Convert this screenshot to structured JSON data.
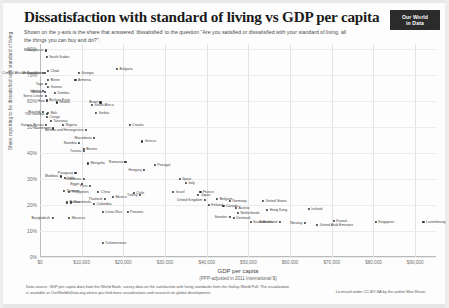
{
  "header": {
    "title": "Dissatisfaction with standard of living vs GDP per capita",
    "subtitle": "Shown on the y-axis is the share that answered 'dissatisfied' to the question \"Are you satisfied or dissatisfied with your standard of living, all the things you can buy and do?\".",
    "logo_line1": "Our World",
    "logo_line2": "in Data"
  },
  "footer": {
    "source": "Data source: GDP per capita data from the World Bank; survey data on the satisfaction with living standards from the Gallup World Poll. The visualization is available at OurWorldInData.org where you find more visualizations and research on global development.",
    "license": "Licensed under CC-BY-SA by the author Max Roser."
  },
  "axes": {
    "y_title": "Share reporting to be dissatisfied with standard of living",
    "x_title": "GDP per capita",
    "x_subtitle": "(PPP-adjusted in 2011 international-$)",
    "y_ticks": [
      "80%",
      "70%",
      "60%",
      "50%",
      "40%",
      "30%",
      "20%",
      "10%",
      "0%"
    ],
    "x_ticks": [
      "$0",
      "$10,000",
      "$20,000",
      "$30,000",
      "$40,000",
      "$50,000",
      "$60,000",
      "$70,000",
      "$80,000",
      "$90,000"
    ]
  },
  "chart_data": {
    "type": "scatter",
    "title": "Dissatisfaction with standard of living vs GDP per capita",
    "xlabel": "GDP per capita (PPP-adjusted in 2011 international-$)",
    "ylabel": "Share reporting to be dissatisfied with standard of living",
    "xlim": [
      0,
      95000
    ],
    "ylim": [
      0,
      82
    ],
    "grid": true,
    "legend": "none",
    "x_unit": "international-$",
    "y_unit": "percent",
    "points": [
      {
        "name": "Madagascar",
        "x": 1400,
        "y": 79.5,
        "side": "left"
      },
      {
        "name": "South Sudan",
        "x": 1600,
        "y": 77.0,
        "side": "right"
      },
      {
        "name": "Chad",
        "x": 1900,
        "y": 71.5,
        "side": "right"
      },
      {
        "name": "Central African Republic",
        "x": 700,
        "y": 71.0,
        "side": "left"
      },
      {
        "name": "Mozambique",
        "x": 1100,
        "y": 71.0,
        "side": "left"
      },
      {
        "name": "Georgia",
        "x": 9300,
        "y": 71.0,
        "side": "right"
      },
      {
        "name": "Bulgaria",
        "x": 18500,
        "y": 72.5,
        "side": "right"
      },
      {
        "name": "Benin",
        "x": 2000,
        "y": 68.0,
        "side": "right"
      },
      {
        "name": "Armenia",
        "x": 8500,
        "y": 68.0,
        "side": "right"
      },
      {
        "name": "Togo",
        "x": 1400,
        "y": 66.5,
        "side": "left"
      },
      {
        "name": "Guinea",
        "x": 1900,
        "y": 65.5,
        "side": "right"
      },
      {
        "name": "Liberia",
        "x": 800,
        "y": 64.0,
        "side": "left"
      },
      {
        "name": "Malawi",
        "x": 1100,
        "y": 63.5,
        "side": "left"
      },
      {
        "name": "Zambia",
        "x": 3600,
        "y": 63.0,
        "side": "right"
      },
      {
        "name": "Sierra Leone",
        "x": 1400,
        "y": 62.0,
        "side": "left"
      },
      {
        "name": "Burkina Faso",
        "x": 1600,
        "y": 60.5,
        "side": "right"
      },
      {
        "name": "Haiti",
        "x": 1700,
        "y": 60.0,
        "side": "left"
      },
      {
        "name": "Brazil",
        "x": 14500,
        "y": 59.5,
        "side": "left"
      },
      {
        "name": "Ghana",
        "x": 4000,
        "y": 59.5,
        "side": "right"
      },
      {
        "name": "South Africa",
        "x": 12500,
        "y": 58.5,
        "side": "right"
      },
      {
        "name": "Burundi",
        "x": 700,
        "y": 56.0,
        "side": "left"
      },
      {
        "name": "Mali",
        "x": 1900,
        "y": 55.5,
        "side": "right"
      },
      {
        "name": "Serbia",
        "x": 13500,
        "y": 55.5,
        "side": "right"
      },
      {
        "name": "The Gambia",
        "x": 1600,
        "y": 55.0,
        "side": "left"
      },
      {
        "name": "Congo",
        "x": 1700,
        "y": 54.0,
        "side": "right"
      },
      {
        "name": "Tanzania",
        "x": 2600,
        "y": 52.5,
        "side": "right"
      },
      {
        "name": "Guinea-Bissau",
        "x": 1500,
        "y": 51.0,
        "side": "left"
      },
      {
        "name": "Nigeria",
        "x": 5600,
        "y": 51.0,
        "side": "right"
      },
      {
        "name": "Croatia",
        "x": 21500,
        "y": 51.0,
        "side": "right"
      },
      {
        "name": "Cameroon",
        "x": 3200,
        "y": 49.5,
        "side": "left"
      },
      {
        "name": "Bosnia and Herzegovina",
        "x": 11000,
        "y": 49.0,
        "side": "left"
      },
      {
        "name": "Macedonia",
        "x": 13000,
        "y": 46.0,
        "side": "left"
      },
      {
        "name": "Greece",
        "x": 24500,
        "y": 44.5,
        "side": "right"
      },
      {
        "name": "Namibia",
        "x": 9400,
        "y": 44.0,
        "side": "left"
      },
      {
        "name": "Tunisia",
        "x": 10500,
        "y": 41.0,
        "side": "left"
      },
      {
        "name": "Bosnia",
        "x": 10500,
        "y": 41.5,
        "side": "right"
      },
      {
        "name": "Romania",
        "x": 20500,
        "y": 36.5,
        "side": "left"
      },
      {
        "name": "Mongolia",
        "x": 11500,
        "y": 36.0,
        "side": "right"
      },
      {
        "name": "Portugal",
        "x": 27500,
        "y": 35.5,
        "side": "right"
      },
      {
        "name": "Hungary",
        "x": 25000,
        "y": 33.5,
        "side": "left"
      },
      {
        "name": "Paraguay",
        "x": 8500,
        "y": 32.5,
        "side": "left"
      },
      {
        "name": "Moldova",
        "x": 5000,
        "y": 31.0,
        "side": "left"
      },
      {
        "name": "India",
        "x": 6000,
        "y": 30.5,
        "side": "right"
      },
      {
        "name": "Indonesia",
        "x": 10500,
        "y": 30.0,
        "side": "left"
      },
      {
        "name": "Spain",
        "x": 33500,
        "y": 30.0,
        "side": "right"
      },
      {
        "name": "Italy",
        "x": 35000,
        "y": 28.5,
        "side": "right"
      },
      {
        "name": "Egypt",
        "x": 10000,
        "y": 28.0,
        "side": "left"
      },
      {
        "name": "Peru",
        "x": 12000,
        "y": 27.5,
        "side": "left"
      },
      {
        "name": "Vietnam",
        "x": 5800,
        "y": 25.5,
        "side": "right"
      },
      {
        "name": "Philippines",
        "x": 7000,
        "y": 25.0,
        "side": "right"
      },
      {
        "name": "China",
        "x": 14000,
        "y": 25.0,
        "side": "right"
      },
      {
        "name": "Israel",
        "x": 32000,
        "y": 25.0,
        "side": "right"
      },
      {
        "name": "France",
        "x": 38500,
        "y": 25.0,
        "side": "right"
      },
      {
        "name": "Japan",
        "x": 38000,
        "y": 24.0,
        "side": "right"
      },
      {
        "name": "Chile",
        "x": 22500,
        "y": 24.5,
        "side": "right"
      },
      {
        "name": "Turkey",
        "x": 24000,
        "y": 24.0,
        "side": "left"
      },
      {
        "name": "Mexico",
        "x": 17500,
        "y": 23.0,
        "side": "right"
      },
      {
        "name": "Thailand",
        "x": 15500,
        "y": 22.5,
        "side": "left"
      },
      {
        "name": "Belgium",
        "x": 42500,
        "y": 22.5,
        "side": "right"
      },
      {
        "name": "Germany",
        "x": 45500,
        "y": 21.5,
        "side": "right"
      },
      {
        "name": "United Kingdom",
        "x": 39500,
        "y": 22.0,
        "side": "left"
      },
      {
        "name": "Guatemala",
        "x": 7500,
        "y": 21.0,
        "side": "right"
      },
      {
        "name": "Bolivia",
        "x": 6500,
        "y": 21.0,
        "side": "right"
      },
      {
        "name": "Colombia",
        "x": 13000,
        "y": 20.5,
        "side": "right"
      },
      {
        "name": "Finland",
        "x": 40500,
        "y": 20.0,
        "side": "right"
      },
      {
        "name": "Canada",
        "x": 44000,
        "y": 19.5,
        "side": "right"
      },
      {
        "name": "Austria",
        "x": 47000,
        "y": 19.0,
        "side": "right"
      },
      {
        "name": "Costa Rica",
        "x": 15000,
        "y": 17.5,
        "side": "right"
      },
      {
        "name": "Panama",
        "x": 21000,
        "y": 17.5,
        "side": "right"
      },
      {
        "name": "United States",
        "x": 53500,
        "y": 21.5,
        "side": "right"
      },
      {
        "name": "Hong Kong",
        "x": 54500,
        "y": 18.0,
        "side": "right"
      },
      {
        "name": "Ireland",
        "x": 64500,
        "y": 18.5,
        "side": "right"
      },
      {
        "name": "Netherlands",
        "x": 47500,
        "y": 17.0,
        "side": "right"
      },
      {
        "name": "Sweden",
        "x": 45500,
        "y": 15.5,
        "side": "left"
      },
      {
        "name": "Denmark",
        "x": 46500,
        "y": 15.0,
        "side": "right"
      },
      {
        "name": "Bangladesh",
        "x": 3000,
        "y": 15.0,
        "side": "left"
      },
      {
        "name": "Morocco",
        "x": 7000,
        "y": 15.0,
        "side": "right"
      },
      {
        "name": "Saudi Arabia",
        "x": 50500,
        "y": 13.5,
        "side": "right"
      },
      {
        "name": "Switzerland",
        "x": 57500,
        "y": 13.5,
        "side": "left"
      },
      {
        "name": "Norway",
        "x": 63500,
        "y": 13.0,
        "side": "left"
      },
      {
        "name": "Kuwait",
        "x": 70500,
        "y": 14.0,
        "side": "right"
      },
      {
        "name": "United Arab Emirates",
        "x": 66500,
        "y": 12.5,
        "side": "right"
      },
      {
        "name": "Singapore",
        "x": 80500,
        "y": 13.5,
        "side": "right"
      },
      {
        "name": "Luxembourg",
        "x": 92000,
        "y": 13.5,
        "side": "right"
      },
      {
        "name": "Turkmenistan",
        "x": 15000,
        "y": 5.5,
        "side": "right"
      }
    ]
  }
}
